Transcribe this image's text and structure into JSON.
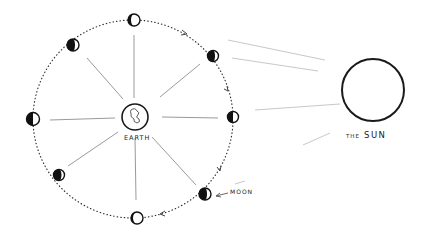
{
  "diagram": {
    "title": "",
    "labels": {
      "earth": "EARTH",
      "sun_prefix": "THE",
      "sun_name": "SUN",
      "moon": "MOON"
    },
    "colors": {
      "ink": "#1a1a1a",
      "rays": "#c8c8c8",
      "spokes": "#9a9a9a",
      "background": "#ffffff"
    },
    "earth": {
      "cx": 135,
      "cy": 117,
      "r": 13
    },
    "sun": {
      "cx": 373,
      "cy": 90,
      "r": 31
    },
    "moons": [
      {
        "position": "top",
        "cx": 134,
        "cy": 20
      },
      {
        "position": "upper-right",
        "cx": 213,
        "cy": 56
      },
      {
        "position": "right",
        "cx": 233,
        "cy": 117
      },
      {
        "position": "lower-right",
        "cx": 205,
        "cy": 194
      },
      {
        "position": "bottom",
        "cx": 137,
        "cy": 218
      },
      {
        "position": "lower-left",
        "cx": 59,
        "cy": 175
      },
      {
        "position": "left",
        "cx": 33,
        "cy": 119
      },
      {
        "position": "upper-left",
        "cx": 73,
        "cy": 45
      }
    ],
    "orbit_direction": "clockwise"
  }
}
